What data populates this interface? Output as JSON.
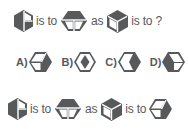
{
  "colors": {
    "shape_fill": "#58595b",
    "line": "#ffffff",
    "text": "#58595b"
  },
  "question": {
    "text_is_to_1": "is to",
    "text_as": "as",
    "text_is_to_2": "is to ?",
    "shapes": [
      "hexagon-half-split-icon",
      "hexagon-top-band-icon",
      "hexagon-cube-icon"
    ]
  },
  "options": [
    {
      "label": "A)",
      "shape": "hexagon-cube-rotated-icon"
    },
    {
      "label": "B)",
      "shape": "hexagon-diamond-icon"
    },
    {
      "label": "C)",
      "shape": "hexagon-right-wedge-icon"
    },
    {
      "label": "D)",
      "shape": "hexagon-dark-cube-icon"
    }
  ],
  "answer": {
    "text_is_to_1": "is to",
    "text_as": "as",
    "text_is_to_2": "is to",
    "shapes": [
      "hexagon-half-split-icon",
      "hexagon-top-band-icon",
      "hexagon-cube-icon",
      "hexagon-cube-rotated-icon"
    ]
  }
}
